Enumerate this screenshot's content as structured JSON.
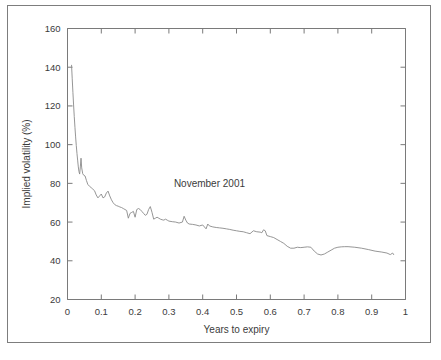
{
  "figure": {
    "frame_color": "#7d7d7d",
    "background": "#ffffff"
  },
  "chart_data": {
    "type": "line",
    "title": "",
    "xlabel": "Years to expiry",
    "ylabel": "Implied volatility (%)",
    "xlim": [
      0,
      1
    ],
    "ylim": [
      20,
      160
    ],
    "xticks": [
      0,
      0.1,
      0.2,
      0.3,
      0.4,
      0.5,
      0.6,
      0.7,
      0.8,
      0.9,
      1
    ],
    "xtick_labels": [
      "0",
      "0.1",
      "0.2",
      "0.3",
      "0.4",
      "0.5",
      "0.6",
      "0.7",
      "0.8",
      "0.9",
      "1"
    ],
    "yticks": [
      20,
      40,
      60,
      80,
      100,
      120,
      140,
      160
    ],
    "ytick_labels": [
      "20",
      "40",
      "60",
      "80",
      "100",
      "120",
      "140",
      "160"
    ],
    "grid": false,
    "legend": null,
    "annotations": [
      {
        "text": "November 2001",
        "x": 0.42,
        "y": 78
      }
    ],
    "line_color": "#8a8a8a",
    "series": [
      {
        "name": "Implied volatility term structure",
        "x": [
          0.012,
          0.014,
          0.016,
          0.018,
          0.02,
          0.022,
          0.024,
          0.026,
          0.028,
          0.03,
          0.032,
          0.034,
          0.036,
          0.038,
          0.04,
          0.042,
          0.045,
          0.048,
          0.052,
          0.056,
          0.06,
          0.065,
          0.07,
          0.075,
          0.08,
          0.085,
          0.09,
          0.095,
          0.1,
          0.105,
          0.11,
          0.115,
          0.12,
          0.125,
          0.13,
          0.135,
          0.14,
          0.145,
          0.15,
          0.155,
          0.16,
          0.165,
          0.17,
          0.175,
          0.18,
          0.185,
          0.19,
          0.195,
          0.2,
          0.205,
          0.21,
          0.215,
          0.22,
          0.225,
          0.23,
          0.235,
          0.24,
          0.245,
          0.25,
          0.255,
          0.26,
          0.265,
          0.27,
          0.275,
          0.28,
          0.285,
          0.29,
          0.295,
          0.3,
          0.31,
          0.32,
          0.33,
          0.34,
          0.345,
          0.35,
          0.355,
          0.36,
          0.37,
          0.38,
          0.39,
          0.4,
          0.41,
          0.415,
          0.42,
          0.43,
          0.44,
          0.45,
          0.46,
          0.47,
          0.48,
          0.49,
          0.5,
          0.51,
          0.52,
          0.53,
          0.54,
          0.55,
          0.56,
          0.57,
          0.575,
          0.58,
          0.585,
          0.59,
          0.6,
          0.61,
          0.62,
          0.63,
          0.64,
          0.65,
          0.66,
          0.67,
          0.68,
          0.69,
          0.7,
          0.71,
          0.72,
          0.73,
          0.74,
          0.75,
          0.76,
          0.77,
          0.78,
          0.79,
          0.8,
          0.81,
          0.82,
          0.83,
          0.85,
          0.87,
          0.89,
          0.91,
          0.93,
          0.945,
          0.955,
          0.962,
          0.965
        ],
        "y": [
          141.0,
          134.0,
          127.0,
          120.5,
          114.5,
          109.0,
          104.0,
          99.5,
          95.5,
          92.0,
          88.5,
          86.0,
          84.8,
          88.5,
          93.0,
          88.0,
          85.0,
          84.2,
          83.8,
          81.5,
          79.5,
          78.5,
          77.8,
          77.0,
          76.2,
          74.0,
          72.5,
          73.5,
          74.5,
          72.5,
          73.0,
          75.0,
          76.0,
          73.5,
          71.5,
          70.0,
          69.0,
          68.5,
          68.2,
          67.8,
          67.5,
          67.0,
          66.5,
          66.0,
          62.0,
          64.5,
          65.0,
          65.5,
          62.5,
          66.5,
          67.0,
          66.5,
          65.5,
          64.5,
          63.5,
          64.0,
          66.5,
          68.0,
          65.0,
          61.5,
          62.0,
          62.5,
          62.0,
          61.5,
          61.2,
          61.0,
          61.5,
          61.0,
          60.5,
          60.2,
          60.0,
          59.5,
          60.0,
          63.0,
          61.0,
          59.5,
          59.0,
          58.8,
          58.5,
          58.0,
          58.5,
          56.5,
          59.0,
          58.0,
          57.5,
          57.2,
          57.0,
          56.8,
          56.5,
          56.2,
          55.8,
          55.5,
          55.2,
          55.0,
          54.5,
          54.0,
          55.5,
          55.0,
          54.8,
          54.5,
          56.0,
          55.5,
          53.0,
          52.5,
          52.0,
          51.0,
          50.0,
          49.0,
          47.5,
          46.5,
          46.5,
          47.0,
          46.8,
          47.0,
          47.2,
          47.0,
          45.0,
          43.5,
          43.0,
          43.5,
          44.5,
          45.5,
          46.5,
          47.0,
          47.2,
          47.3,
          47.3,
          47.0,
          46.5,
          45.8,
          45.0,
          44.5,
          44.0,
          43.2,
          44.0,
          43.2
        ]
      }
    ]
  }
}
